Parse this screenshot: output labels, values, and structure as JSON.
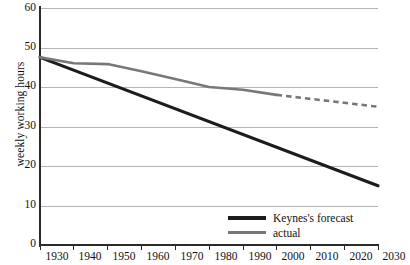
{
  "chart_data": {
    "type": "line",
    "title": "",
    "xlabel": "",
    "ylabel": "weekly working hours",
    "xlim": [
      1930,
      2030
    ],
    "ylim": [
      0,
      60
    ],
    "grid": true,
    "legend_position": "bottom-right-inside",
    "x": [
      1930,
      1940,
      1950,
      1960,
      1970,
      1980,
      1990,
      2000,
      2010,
      2020,
      2030
    ],
    "xtick_labels": [
      "1930",
      "1940",
      "1950",
      "1960",
      "1970",
      "1980",
      "1990",
      "2000",
      "2010",
      "2020",
      "2030"
    ],
    "ytick_labels": [
      "0",
      "10",
      "20",
      "30",
      "40",
      "50",
      "60"
    ],
    "ytick_values": [
      0,
      10,
      20,
      30,
      40,
      50,
      60
    ],
    "series": [
      {
        "name": "Keynes's forecast",
        "color": "#1c1c1c",
        "style": "solid",
        "width": 3.2,
        "x": [
          1930,
          2030
        ],
        "values": [
          47.5,
          15.0
        ]
      },
      {
        "name": "actual",
        "color": "#787878",
        "style": "solid",
        "width": 2.6,
        "x": [
          1930,
          1940,
          1950,
          1960,
          1970,
          1980,
          1990,
          2000
        ],
        "values": [
          47.5,
          46.0,
          45.8,
          44.0,
          42.0,
          40.0,
          39.3,
          38.0
        ]
      },
      {
        "name": "actual (projected)",
        "color": "#787878",
        "style": "dashed",
        "width": 2.6,
        "x": [
          2000,
          2010,
          2020,
          2030
        ],
        "values": [
          38.0,
          37.0,
          36.0,
          35.0
        ]
      }
    ],
    "legend": [
      {
        "label": "Keynes's forecast",
        "color": "#1c1c1c",
        "style": "solid"
      },
      {
        "label": "actual",
        "color": "#787878",
        "style": "solid"
      }
    ],
    "colors": {
      "forecast": "#1c1c1c",
      "actual": "#787878",
      "gridline": "#b4b4b4",
      "axis": "#2b2b2b",
      "background": "#ffffff"
    }
  }
}
